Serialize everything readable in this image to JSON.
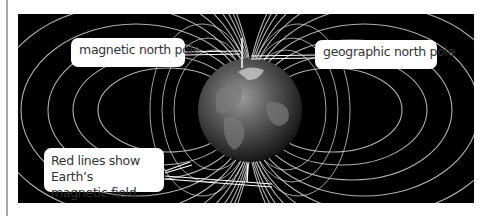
{
  "diagram": {
    "labels": {
      "magnetic_north_pole": "magnetic north pole",
      "geographic_north_pole": "geographic north pole",
      "field_caption_line1": "Red lines show Earth’s",
      "field_caption_line2": "magnetic field."
    },
    "colors": {
      "background": "#000000",
      "field_lines": "#d8d8d8",
      "label_box": "#ffffff",
      "label_text": "#333333",
      "side_rule": "#a8a8a8"
    }
  }
}
